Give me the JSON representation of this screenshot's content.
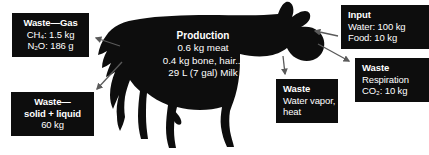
{
  "figure": {
    "silhouette_label": "cow-silhouette",
    "colors": {
      "silhouette": "#0d0d0d",
      "box_background": "#0d0d0d",
      "box_text": "#ffffff",
      "page_background": "#ffffff",
      "arrow": "#4a4a4a"
    }
  },
  "callouts": {
    "waste_gas": {
      "title": "Waste—Gas",
      "lines": [
        "CH₄: 1.5 kg",
        "N₂O: 186 g"
      ],
      "align": "center"
    },
    "waste_solid_liquid": {
      "title": "Waste—",
      "lines": [
        "solid + liquid",
        "60 kg"
      ],
      "align": "center"
    },
    "production": {
      "title": "Production",
      "lines": [
        "0.6 kg meat",
        "0.4 kg bone, hair...",
        "29 L (7 gal) Milk"
      ],
      "align": "center"
    },
    "input": {
      "title": "Input",
      "lines": [
        "Water: 100 kg",
        "Food: 10 kg"
      ],
      "align": "left"
    },
    "waste_respiration": {
      "title": "Waste",
      "lines": [
        "Respiration",
        "CO₂: 10 kg"
      ],
      "align": "left"
    },
    "waste_water_vapor": {
      "title": "Waste",
      "lines": [
        "Water vapor,",
        "heat"
      ],
      "align": "left"
    }
  },
  "arrows": [
    {
      "name": "arrow-to-waste-gas",
      "direction": "left",
      "from": "cow-body",
      "to": "waste_gas"
    },
    {
      "name": "arrow-to-waste-solid-liquid",
      "direction": "down-left",
      "from": "cow-body",
      "to": "waste_solid_liquid"
    },
    {
      "name": "arrow-from-input",
      "direction": "left",
      "from": "input",
      "to": "cow-head"
    },
    {
      "name": "arrow-to-waste-respiration",
      "direction": "down-right",
      "from": "cow-head",
      "to": "waste_respiration"
    },
    {
      "name": "arrow-to-waste-water-vapor",
      "direction": "down",
      "from": "cow-body",
      "to": "waste_water_vapor"
    }
  ]
}
